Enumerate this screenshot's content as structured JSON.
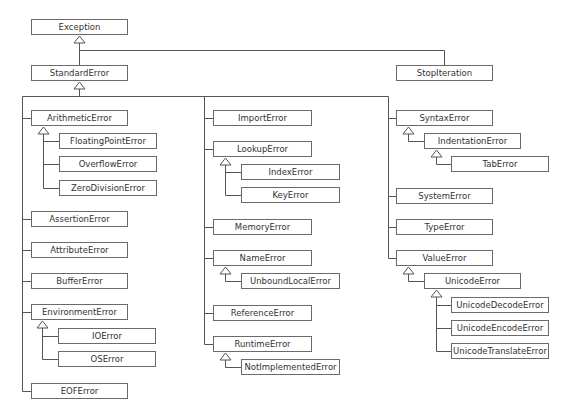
{
  "nodes": [
    {
      "id": "Exception",
      "label": "Exception",
      "x": 31,
      "y": 19,
      "w": 97
    },
    {
      "id": "StandardError",
      "label": "StandardError",
      "x": 31,
      "y": 65,
      "w": 97
    },
    {
      "id": "StopIteration",
      "label": "StopIteration",
      "x": 396,
      "y": 65,
      "w": 97
    },
    {
      "id": "ArithmeticError",
      "label": "ArithmeticError",
      "x": 31,
      "y": 110,
      "w": 97
    },
    {
      "id": "FloatingPointError",
      "label": "FloatingPointError",
      "x": 59,
      "y": 133,
      "w": 98
    },
    {
      "id": "OverflowError",
      "label": "OverflowError",
      "x": 59,
      "y": 156,
      "w": 98
    },
    {
      "id": "ZeroDivisionError",
      "label": "ZeroDivisionError",
      "x": 59,
      "y": 180,
      "w": 98
    },
    {
      "id": "AssertionError",
      "label": "AssertionError",
      "x": 31,
      "y": 211,
      "w": 97
    },
    {
      "id": "AttributeError",
      "label": "AttributeError",
      "x": 31,
      "y": 242,
      "w": 97
    },
    {
      "id": "BufferError",
      "label": "BufferError",
      "x": 31,
      "y": 273,
      "w": 97
    },
    {
      "id": "EnvironmentError",
      "label": "EnvironmentError",
      "x": 31,
      "y": 304,
      "w": 97
    },
    {
      "id": "IOError",
      "label": "IOError",
      "x": 58,
      "y": 328,
      "w": 98
    },
    {
      "id": "OSError",
      "label": "OSError",
      "x": 58,
      "y": 351,
      "w": 98
    },
    {
      "id": "EOFError",
      "label": "EOFError",
      "x": 31,
      "y": 383,
      "w": 97
    },
    {
      "id": "ImportError",
      "label": "ImportError",
      "x": 213,
      "y": 110,
      "w": 99
    },
    {
      "id": "LookupError",
      "label": "LookupError",
      "x": 213,
      "y": 141,
      "w": 99
    },
    {
      "id": "IndexError",
      "label": "IndexError",
      "x": 241,
      "y": 164,
      "w": 99
    },
    {
      "id": "KeyError",
      "label": "KeyError",
      "x": 241,
      "y": 187,
      "w": 99
    },
    {
      "id": "MemoryError",
      "label": "MemoryError",
      "x": 213,
      "y": 219,
      "w": 99
    },
    {
      "id": "NameError",
      "label": "NameError",
      "x": 213,
      "y": 250,
      "w": 99
    },
    {
      "id": "UnboundLocalError",
      "label": "UnboundLocalError",
      "x": 241,
      "y": 273,
      "w": 99
    },
    {
      "id": "ReferenceError",
      "label": "ReferenceError",
      "x": 213,
      "y": 305,
      "w": 99
    },
    {
      "id": "RuntimeError",
      "label": "RuntimeError",
      "x": 213,
      "y": 336,
      "w": 99
    },
    {
      "id": "NotImplementedError",
      "label": "NotImplementedError",
      "x": 241,
      "y": 359,
      "w": 99
    },
    {
      "id": "SyntaxError",
      "label": "SyntaxError",
      "x": 396,
      "y": 110,
      "w": 97
    },
    {
      "id": "IndentationError",
      "label": "IndentationError",
      "x": 424,
      "y": 133,
      "w": 97
    },
    {
      "id": "TabError",
      "label": "TabError",
      "x": 451,
      "y": 156,
      "w": 98
    },
    {
      "id": "SystemError",
      "label": "SystemError",
      "x": 396,
      "y": 188,
      "w": 97
    },
    {
      "id": "TypeError",
      "label": "TypeError",
      "x": 396,
      "y": 219,
      "w": 97
    },
    {
      "id": "ValueError",
      "label": "ValueError",
      "x": 396,
      "y": 250,
      "w": 97
    },
    {
      "id": "UnicodeError",
      "label": "UnicodeError",
      "x": 424,
      "y": 273,
      "w": 97
    },
    {
      "id": "UnicodeDecodeError",
      "label": "UnicodeDecodeError",
      "x": 451,
      "y": 297,
      "w": 98
    },
    {
      "id": "UnicodeEncodeError",
      "label": "UnicodeEncodeError",
      "x": 451,
      "y": 320,
      "w": 98
    },
    {
      "id": "UnicodeTranslateError",
      "label": "UnicodeTranslateError",
      "x": 451,
      "y": 343,
      "w": 98
    }
  ],
  "edges": [
    [
      "StandardError",
      "Exception"
    ],
    [
      "StopIteration",
      "Exception"
    ],
    [
      "ArithmeticError",
      "StandardError"
    ],
    [
      "AssertionError",
      "StandardError"
    ],
    [
      "AttributeError",
      "StandardError"
    ],
    [
      "BufferError",
      "StandardError"
    ],
    [
      "EnvironmentError",
      "StandardError"
    ],
    [
      "EOFError",
      "StandardError"
    ],
    [
      "ImportError",
      "StandardError"
    ],
    [
      "LookupError",
      "StandardError"
    ],
    [
      "MemoryError",
      "StandardError"
    ],
    [
      "NameError",
      "StandardError"
    ],
    [
      "ReferenceError",
      "StandardError"
    ],
    [
      "RuntimeError",
      "StandardError"
    ],
    [
      "SyntaxError",
      "StandardError"
    ],
    [
      "SystemError",
      "StandardError"
    ],
    [
      "TypeError",
      "StandardError"
    ],
    [
      "ValueError",
      "StandardError"
    ],
    [
      "FloatingPointError",
      "ArithmeticError"
    ],
    [
      "OverflowError",
      "ArithmeticError"
    ],
    [
      "ZeroDivisionError",
      "ArithmeticError"
    ],
    [
      "IOError",
      "EnvironmentError"
    ],
    [
      "OSError",
      "EnvironmentError"
    ],
    [
      "IndexError",
      "LookupError"
    ],
    [
      "KeyError",
      "LookupError"
    ],
    [
      "UnboundLocalError",
      "NameError"
    ],
    [
      "NotImplementedError",
      "RuntimeError"
    ],
    [
      "IndentationError",
      "SyntaxError"
    ],
    [
      "TabError",
      "IndentationError"
    ],
    [
      "UnicodeError",
      "ValueError"
    ],
    [
      "UnicodeDecodeError",
      "UnicodeError"
    ],
    [
      "UnicodeEncodeError",
      "UnicodeError"
    ],
    [
      "UnicodeTranslateError",
      "UnicodeError"
    ]
  ],
  "colors": {
    "line": "#555555",
    "border": "#6a6a6a",
    "text": "#333333",
    "background": "#ffffff"
  }
}
